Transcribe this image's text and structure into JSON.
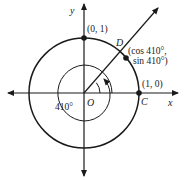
{
  "diagram": {
    "type": "unit-circle",
    "angle_degrees": 410,
    "axes": {
      "x_label": "x",
      "y_label": "y",
      "origin_label": "O"
    },
    "points": [
      {
        "name": "top",
        "label": "(0, 1)"
      },
      {
        "name": "D",
        "label": "D",
        "coord_line1": "(cos 410°,",
        "coord_line2": "sin 410°)"
      },
      {
        "name": "C",
        "label": "C",
        "coord": "(1, 0)"
      }
    ],
    "angle_label": "410°",
    "colors": {
      "ink": "#1a1a1a",
      "background": "#ffffff"
    }
  }
}
